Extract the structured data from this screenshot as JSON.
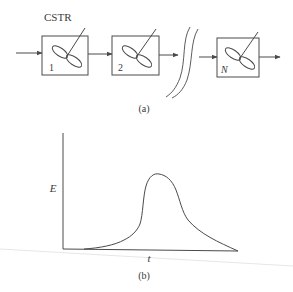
{
  "figure_a": {
    "title_label": "CSTR",
    "caption": "(a)",
    "reactors": [
      {
        "label": "1"
      },
      {
        "label": "2"
      },
      {
        "label": "N"
      }
    ]
  },
  "figure_b": {
    "y_axis_label": "E",
    "x_axis_label": "t",
    "caption": "(b)"
  },
  "colors": {
    "stroke": "#4a4a4a",
    "background": "#ffffff",
    "scan_artifact": "#e6e6e6"
  }
}
